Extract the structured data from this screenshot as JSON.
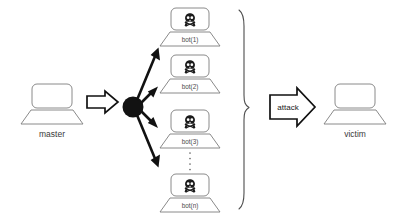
{
  "diagram": {
    "background_color": "#ffffff",
    "line_color": "#7d7d7d",
    "accent_color": "#111111"
  },
  "master": {
    "label": "master",
    "icon": "laptop-icon"
  },
  "command_arrow": {
    "label": "",
    "icon": "block-arrow-right-icon"
  },
  "hub": {
    "icon": "hub-node-icon"
  },
  "bots": [
    {
      "label": "bot(1)",
      "icon": "skull-crossbones-icon"
    },
    {
      "label": "bot(2)",
      "icon": "skull-crossbones-icon"
    },
    {
      "label": "bot(3)",
      "icon": "skull-crossbones-icon"
    },
    {
      "label": "bot(n)",
      "icon": "skull-crossbones-icon"
    }
  ],
  "ellipsis": {
    "icon": "vertical-ellipsis-icon",
    "dots": 4
  },
  "brace": {
    "icon": "curly-brace-right-icon"
  },
  "attack_arrow": {
    "label": "attack",
    "icon": "block-arrow-right-icon"
  },
  "victim": {
    "label": "victim",
    "icon": "laptop-icon"
  }
}
